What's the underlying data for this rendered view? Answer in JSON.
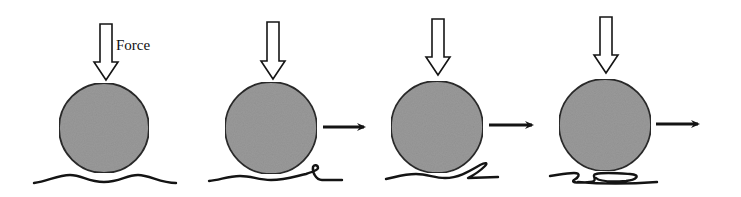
{
  "diagram": {
    "type": "rolling-ball-deformation-sequence",
    "force_label": "Force",
    "colors": {
      "ball_fill": "#9a9a9a",
      "ball_stroke": "#2a2a2a",
      "ink": "#141414",
      "background": "#ffffff"
    },
    "panels": [
      {
        "id": 1,
        "description": "Ball pressed down by force onto flexible surface; surface deforms symmetrically",
        "has_motion_arrow": false,
        "surface_state": "symmetric-dip"
      },
      {
        "id": 2,
        "description": "Ball rolls right; surface bunches up ahead into a small loop",
        "has_motion_arrow": true,
        "surface_state": "small-wrinkle"
      },
      {
        "id": 3,
        "description": "Ball continues right; wrinkle folds over into a flap",
        "has_motion_arrow": true,
        "surface_state": "folded-flap"
      },
      {
        "id": 4,
        "description": "Ball moves further; surface layers pile into multiple folds beneath ball",
        "has_motion_arrow": true,
        "surface_state": "multi-fold-pile"
      }
    ]
  }
}
